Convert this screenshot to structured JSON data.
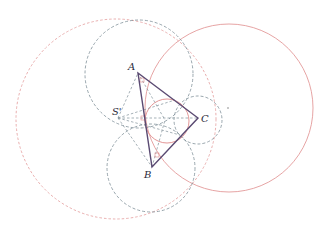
{
  "diagram": {
    "colors": {
      "triangle": "#5a4a72",
      "red": "#e08a8a",
      "gray": "#7a8a92",
      "dot": "#666666"
    },
    "points": {
      "A": {
        "label": "A",
        "x": 138,
        "y": 73
      },
      "B": {
        "label": "B",
        "x": 152,
        "y": 167
      },
      "C": {
        "label": "C",
        "x": 198,
        "y": 118
      },
      "S": {
        "label": "S'",
        "x": 118,
        "y": 118
      }
    },
    "labels": {
      "A": "A",
      "B": "B",
      "C": "C",
      "S": "S'"
    },
    "circles": [
      {
        "name": "large-red-dashed-circle",
        "cx": 116,
        "cy": 119,
        "r": 100,
        "style": "red-dashed"
      },
      {
        "name": "red-solid-circle",
        "cx": 229,
        "cy": 108,
        "r": 84,
        "style": "red-solid"
      },
      {
        "name": "gray-dashed-circle-a",
        "cx": 139,
        "cy": 74,
        "r": 54,
        "style": "gray-dashed"
      },
      {
        "name": "gray-dashed-circle-b",
        "cx": 151,
        "cy": 168,
        "r": 44,
        "style": "gray-dashed"
      },
      {
        "name": "gray-dashed-circle-c",
        "cx": 198,
        "cy": 120,
        "r": 24,
        "style": "gray-dashed"
      },
      {
        "name": "red-solid-incircle",
        "cx": 167,
        "cy": 121,
        "r": 22,
        "style": "red-solid"
      }
    ]
  }
}
